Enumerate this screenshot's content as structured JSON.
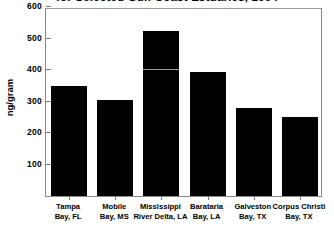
{
  "chart_data": {
    "type": "bar",
    "title": "for Selected Gulf Coast Estuaries, 1994",
    "xlabel": "",
    "ylabel": "ng/gram",
    "ylim": [
      0,
      600
    ],
    "yticks": [
      100,
      200,
      300,
      400,
      500,
      600
    ],
    "grid": false,
    "legend": null,
    "categories": [
      "Tampa\nBay, FL",
      "Mobile\nBay, MS",
      "Mississippi\nRiver Delta, LA",
      "Barataria\nBay, LA",
      "Galveston\nBay, TX",
      "Corpus Christi\nBay, TX"
    ],
    "category_lines": [
      [
        "Tampa",
        "Bay, FL"
      ],
      [
        "Mobile",
        "Bay, MS"
      ],
      [
        "Mississippi",
        "River Delta, LA"
      ],
      [
        "Barataria",
        "Bay, LA"
      ],
      [
        "Galveston",
        "Bay, TX"
      ],
      [
        "Corpus Christi",
        "Bay, TX"
      ]
    ],
    "values": [
      350,
      305,
      525,
      395,
      280,
      250
    ],
    "bar_color": "#000000",
    "annotations": [
      {
        "type": "horizontal-line-in-bar",
        "category": "Mississippi River Delta, LA",
        "value": 400,
        "color": "#9c9c9c"
      }
    ]
  },
  "axis": {
    "y_labels": [
      "600",
      "500",
      "400",
      "300",
      "200",
      "100"
    ],
    "y_title": "ng/gram"
  },
  "header": {
    "title": "for Selected Gulf Coast Estuaries, 1994"
  }
}
